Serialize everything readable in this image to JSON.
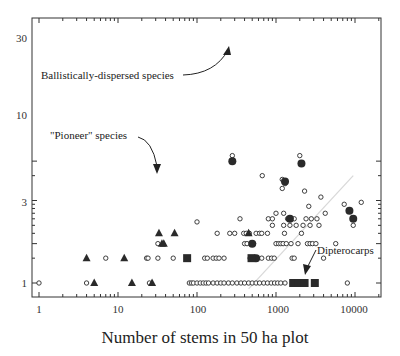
{
  "chart_data": {
    "type": "scatter",
    "title": "",
    "xlabel": "Number of stems in 50 ha plot",
    "ylabel": "",
    "xscale": "log",
    "yscale": "log",
    "xlim": [
      0.9,
      15000
    ],
    "ylim": [
      0.8,
      40
    ],
    "x_ticks": [
      1,
      10,
      100,
      1000,
      10000
    ],
    "x_tick_labels": [
      "1",
      "10",
      "100",
      "1000",
      "10000"
    ],
    "y_ticks": [
      1,
      3,
      10,
      30
    ],
    "y_tick_labels": [
      "1",
      "3",
      "10",
      "30"
    ],
    "grid": false,
    "legend": null,
    "series": [
      {
        "name": "Other species",
        "marker": "open-circle",
        "points": [
          [
            1,
            1
          ],
          [
            4,
            1
          ],
          [
            25,
            1
          ],
          [
            80,
            1
          ],
          [
            85,
            1
          ],
          [
            90,
            1
          ],
          [
            100,
            1
          ],
          [
            110,
            1
          ],
          [
            120,
            1
          ],
          [
            130,
            1
          ],
          [
            140,
            1
          ],
          [
            160,
            1
          ],
          [
            180,
            1
          ],
          [
            200,
            1
          ],
          [
            220,
            1
          ],
          [
            250,
            1
          ],
          [
            280,
            1
          ],
          [
            320,
            1
          ],
          [
            360,
            1
          ],
          [
            400,
            1
          ],
          [
            450,
            1
          ],
          [
            500,
            1
          ],
          [
            560,
            1
          ],
          [
            620,
            1
          ],
          [
            700,
            1
          ],
          [
            780,
            1
          ],
          [
            870,
            1
          ],
          [
            960,
            1
          ],
          [
            1050,
            1
          ],
          [
            1150,
            1
          ],
          [
            1300,
            1
          ],
          [
            8000,
            1
          ],
          [
            7,
            2
          ],
          [
            23,
            2
          ],
          [
            24,
            2
          ],
          [
            32,
            2
          ],
          [
            50,
            2
          ],
          [
            125,
            2
          ],
          [
            135,
            2
          ],
          [
            160,
            2
          ],
          [
            175,
            2
          ],
          [
            190,
            2
          ],
          [
            220,
            2
          ],
          [
            470,
            2
          ],
          [
            560,
            2
          ],
          [
            660,
            2
          ],
          [
            800,
            2
          ],
          [
            880,
            2
          ],
          [
            950,
            2
          ],
          [
            1600,
            2
          ],
          [
            1700,
            2
          ],
          [
            4000,
            2
          ],
          [
            32,
            3
          ],
          [
            400,
            3
          ],
          [
            430,
            3
          ],
          [
            520,
            3
          ],
          [
            1000,
            3
          ],
          [
            1080,
            3
          ],
          [
            1150,
            3
          ],
          [
            1230,
            3
          ],
          [
            1350,
            3
          ],
          [
            1550,
            3
          ],
          [
            1900,
            3
          ],
          [
            2500,
            3
          ],
          [
            2700,
            3
          ],
          [
            2900,
            3
          ],
          [
            3200,
            3
          ],
          [
            5700,
            3
          ],
          [
            180,
            4
          ],
          [
            260,
            4
          ],
          [
            300,
            4
          ],
          [
            390,
            4
          ],
          [
            420,
            4
          ],
          [
            460,
            4
          ],
          [
            560,
            4
          ],
          [
            620,
            4
          ],
          [
            660,
            4
          ],
          [
            780,
            4
          ],
          [
            1280,
            4
          ],
          [
            2100,
            4
          ],
          [
            900,
            5
          ],
          [
            1250,
            5
          ],
          [
            1500,
            5
          ],
          [
            1800,
            5
          ],
          [
            2200,
            5
          ],
          [
            2700,
            5
          ],
          [
            3500,
            5
          ],
          [
            9500,
            5
          ],
          [
            350,
            6
          ],
          [
            800,
            6
          ],
          [
            900,
            6
          ],
          [
            1400,
            6
          ],
          [
            1700,
            6
          ],
          [
            2400,
            6
          ],
          [
            2800,
            6
          ],
          [
            3300,
            6
          ],
          [
            100,
            5.5
          ],
          [
            1000,
            7
          ],
          [
            1250,
            7
          ],
          [
            4200,
            7
          ],
          [
            2600,
            8.5
          ],
          [
            7300,
            9
          ],
          [
            12000,
            9.5
          ],
          [
            3700,
            11
          ],
          [
            2300,
            13
          ],
          [
            1200,
            14
          ],
          [
            1300,
            16
          ],
          [
            1200,
            18
          ],
          [
            670,
            20
          ],
          [
            280,
            35
          ],
          [
            2000,
            35
          ]
        ]
      },
      {
        "name": "Ballistically-dispersed species",
        "marker": "filled-circle",
        "points": [
          [
            280,
            30
          ],
          [
            2100,
            28
          ],
          [
            1300,
            17
          ],
          [
            500,
            3
          ],
          [
            560,
            2
          ],
          [
            1500,
            6
          ],
          [
            8500,
            7.5
          ],
          [
            9500,
            6
          ]
        ]
      },
      {
        "name": "\"Pioneer\" species",
        "marker": "filled-triangle",
        "points": [
          [
            4,
            2
          ],
          [
            12,
            2
          ],
          [
            5,
            1
          ],
          [
            15,
            1
          ],
          [
            27,
            1
          ],
          [
            33,
            4
          ],
          [
            52,
            4
          ],
          [
            36,
            3
          ],
          [
            38,
            3
          ],
          [
            450,
            4
          ]
        ]
      },
      {
        "name": "Dipterocarps",
        "marker": "filled-square",
        "points": [
          [
            75,
            2
          ],
          [
            490,
            2
          ],
          [
            1650,
            1
          ],
          [
            1900,
            1
          ],
          [
            2300,
            1
          ],
          [
            3100,
            1
          ]
        ]
      }
    ],
    "reference_line": {
      "style": "light grey diagonal",
      "from": [
        450,
        0.85
      ],
      "to": [
        9500,
        20
      ]
    },
    "annotations": [
      {
        "text": "Ballistically-dispersed species",
        "arrow_to": [
          280,
          30
        ]
      },
      {
        "text": "\"Pioneer\" species",
        "arrow_to": [
          33,
          4
        ]
      },
      {
        "text": "Dipterocarps",
        "arrow_to": [
          2300,
          1
        ]
      }
    ]
  },
  "labels": {
    "xlabel": "Number of stems in 50 ha plot",
    "annot_ballistic": "Ballistically-dispersed species",
    "annot_pioneer": "\"Pioneer\" species",
    "annot_dipt": "Dipterocarps",
    "xt0": "1",
    "xt1": "10",
    "xt2": "100",
    "xt3": "1000",
    "xt4": "10000",
    "yt0": "1",
    "yt1": "3",
    "yt2": "10",
    "yt3": "30"
  },
  "colors": {
    "marker": "#2a2a2a",
    "axis": "#333333",
    "reference_line": "#d8d8d8"
  }
}
